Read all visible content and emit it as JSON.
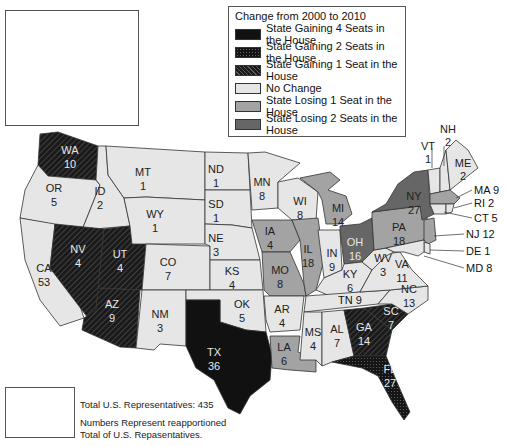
{
  "legend": {
    "title": "Change from 2000 to 2010",
    "items": [
      {
        "label": "State Gaining 4 Seats in the House",
        "pattern": "solid-black",
        "color": "#111111"
      },
      {
        "label": "State Gaining 2 Seats in the House",
        "pattern": "dotted-dark",
        "color": "#1e1e1e"
      },
      {
        "label": "State Gaining 1 Seat in the House",
        "pattern": "hatched",
        "color": "#2a2a2a"
      },
      {
        "label": "No Change",
        "pattern": "solid-light",
        "color": "#e6e6e6"
      },
      {
        "label": "State Losing 1 Seat in the House",
        "pattern": "solid-medium",
        "color": "#a3a3a3"
      },
      {
        "label": "State Losing 2 Seats in the House",
        "pattern": "solid-dark",
        "color": "#666666"
      }
    ]
  },
  "notes": {
    "total": "Total U.S. Representatives: 435",
    "line1": "Numbers Represent reapportioned",
    "line2": "Total of U.S. Repasentatives."
  },
  "states": {
    "AK": {
      "abbr": "AK",
      "seats": "1",
      "change": "none"
    },
    "HI": {
      "abbr": "HI",
      "seats": "2",
      "change": "none"
    },
    "WA": {
      "abbr": "WA",
      "seats": "10",
      "change": "+1"
    },
    "OR": {
      "abbr": "OR",
      "seats": "5",
      "change": "none"
    },
    "CA": {
      "abbr": "CA",
      "seats": "53",
      "change": "none"
    },
    "ID": {
      "abbr": "ID",
      "seats": "2",
      "change": "none"
    },
    "NV": {
      "abbr": "NV",
      "seats": "4",
      "change": "+1"
    },
    "UT": {
      "abbr": "UT",
      "seats": "4",
      "change": "+1"
    },
    "AZ": {
      "abbr": "AZ",
      "seats": "9",
      "change": "+1"
    },
    "MT": {
      "abbr": "MT",
      "seats": "1",
      "change": "none"
    },
    "WY": {
      "abbr": "WY",
      "seats": "1",
      "change": "none"
    },
    "CO": {
      "abbr": "CO",
      "seats": "7",
      "change": "none"
    },
    "NM": {
      "abbr": "NM",
      "seats": "3",
      "change": "none"
    },
    "ND": {
      "abbr": "ND",
      "seats": "1",
      "change": "none"
    },
    "SD": {
      "abbr": "SD",
      "seats": "1",
      "change": "none"
    },
    "NE": {
      "abbr": "NE",
      "seats": "3",
      "change": "none"
    },
    "KS": {
      "abbr": "KS",
      "seats": "4",
      "change": "none"
    },
    "OK": {
      "abbr": "OK",
      "seats": "5",
      "change": "none"
    },
    "TX": {
      "abbr": "TX",
      "seats": "36",
      "change": "+4"
    },
    "MN": {
      "abbr": "MN",
      "seats": "8",
      "change": "none"
    },
    "IA": {
      "abbr": "IA",
      "seats": "4",
      "change": "-1"
    },
    "MO": {
      "abbr": "MO",
      "seats": "8",
      "change": "-1"
    },
    "AR": {
      "abbr": "AR",
      "seats": "4",
      "change": "none"
    },
    "LA": {
      "abbr": "LA",
      "seats": "6",
      "change": "-1"
    },
    "WI": {
      "abbr": "WI",
      "seats": "8",
      "change": "none"
    },
    "IL": {
      "abbr": "IL",
      "seats": "18",
      "change": "-1"
    },
    "MI": {
      "abbr": "MI",
      "seats": "14",
      "change": "-1"
    },
    "IN": {
      "abbr": "IN",
      "seats": "9",
      "change": "none"
    },
    "OH": {
      "abbr": "OH",
      "seats": "16",
      "change": "-2"
    },
    "KY": {
      "abbr": "KY",
      "seats": "6",
      "change": "none"
    },
    "TN": {
      "abbr": "TN",
      "seats": "9",
      "change": "none"
    },
    "MS": {
      "abbr": "MS",
      "seats": "4",
      "change": "none"
    },
    "AL": {
      "abbr": "AL",
      "seats": "7",
      "change": "none"
    },
    "GA": {
      "abbr": "GA",
      "seats": "14",
      "change": "+1"
    },
    "FL": {
      "abbr": "FL",
      "seats": "27",
      "change": "+2"
    },
    "SC": {
      "abbr": "SC",
      "seats": "7",
      "change": "+1"
    },
    "NC": {
      "abbr": "NC",
      "seats": "13",
      "change": "none"
    },
    "VA": {
      "abbr": "VA",
      "seats": "11",
      "change": "none"
    },
    "WV": {
      "abbr": "WV",
      "seats": "3",
      "change": "none"
    },
    "PA": {
      "abbr": "PA",
      "seats": "18",
      "change": "-1"
    },
    "NY": {
      "abbr": "NY",
      "seats": "27",
      "change": "-2"
    },
    "VT": {
      "abbr": "VT",
      "seats": "1",
      "change": "none"
    },
    "NH": {
      "abbr": "NH",
      "seats": "2",
      "change": "none"
    },
    "ME": {
      "abbr": "ME",
      "seats": "2",
      "change": "none"
    },
    "MA": {
      "abbr": "MA",
      "seats": "9",
      "change": "-1"
    },
    "RI": {
      "abbr": "RI",
      "seats": "2",
      "change": "none"
    },
    "CT": {
      "abbr": "CT",
      "seats": "5",
      "change": "none"
    },
    "NJ": {
      "abbr": "NJ",
      "seats": "12",
      "change": "-1"
    },
    "DE": {
      "abbr": "DE",
      "seats": "1",
      "change": "none"
    },
    "MD": {
      "abbr": "MD",
      "seats": "8",
      "change": "none"
    }
  },
  "callouts": {
    "MA": "MA 9",
    "RI": "RI 2",
    "CT": "CT 5",
    "NJ": "NJ 12",
    "DE": "DE 1",
    "MD": "MD 8",
    "TN": "TN 9"
  }
}
